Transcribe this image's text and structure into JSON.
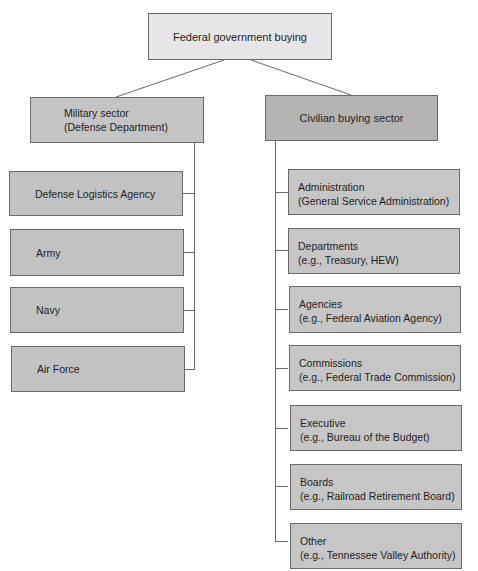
{
  "diagram": {
    "root": {
      "label": "Federal government buying"
    },
    "military": {
      "title": "Military sector",
      "subtitle": "(Defense Department)",
      "children": [
        {
          "label": "Defense Logistics Agency"
        },
        {
          "label": "Army"
        },
        {
          "label": "Navy"
        },
        {
          "label": "Air Force"
        }
      ]
    },
    "civilian": {
      "title": "Civilian buying sector",
      "children": [
        {
          "title": "Administration",
          "example": "(General Service Administration)"
        },
        {
          "title": "Departments",
          "example": "(e.g., Treasury, HEW)"
        },
        {
          "title": "Agencies",
          "example": "(e.g., Federal Aviation Agency)"
        },
        {
          "title": "Commissions",
          "example": "(e.g., Federal Trade Commission)"
        },
        {
          "title": "Executive",
          "example": "(e.g., Bureau of the Budget)"
        },
        {
          "title": "Boards",
          "example": "(e.g., Railroad Retirement Board)"
        },
        {
          "title": "Other",
          "example": "(e.g., Tennessee Valley Authority)"
        }
      ]
    },
    "colors": {
      "root_fill": "#e6e6e6",
      "military_fill": "#c4c4c4",
      "civilian_fill": "#b4b4b4",
      "child_fill": "#c4c4c4",
      "line": "#6a6a6a"
    }
  }
}
